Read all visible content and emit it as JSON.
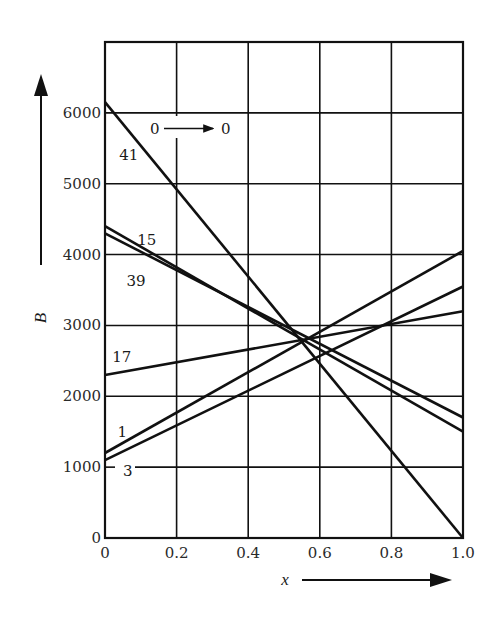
{
  "chart_data": {
    "type": "line",
    "title": "",
    "xlabel": "x",
    "ylabel": "B",
    "xlim": [
      0,
      1.0
    ],
    "ylim": [
      0,
      7000
    ],
    "grid": true,
    "legend": "inline labels near left axis",
    "x_ticks": [
      "0",
      "0.2",
      "0.4",
      "0.6",
      "0.8",
      "1.0"
    ],
    "x_tick_values": [
      0,
      0.2,
      0.4,
      0.6,
      0.8,
      1.0
    ],
    "y_ticks": [
      "0",
      "1000",
      "2000",
      "3000",
      "4000",
      "5000",
      "6000"
    ],
    "y_tick_values": [
      0,
      1000,
      2000,
      3000,
      4000,
      5000,
      6000
    ],
    "y_grid_values": [
      1000,
      2000,
      3000,
      4000,
      5000,
      6000,
      7000
    ],
    "x": [
      0,
      1.0
    ],
    "series": [
      {
        "name": "41",
        "values": [
          6150,
          0
        ],
        "label_pos": [
          0.04,
          5400
        ]
      },
      {
        "name": "15",
        "values": [
          4400,
          1500
        ],
        "label_pos": [
          0.09,
          4200
        ]
      },
      {
        "name": "39",
        "values": [
          4300,
          1700
        ],
        "label_pos": [
          0.06,
          3630
        ]
      },
      {
        "name": "17",
        "values": [
          2300,
          3200
        ],
        "label_pos": [
          0.02,
          2560
        ]
      },
      {
        "name": "1",
        "values": [
          1200,
          4050
        ],
        "label_pos": [
          0.035,
          1500
        ]
      },
      {
        "name": "3",
        "values": [
          1100,
          3550
        ],
        "label_pos": [
          0.05,
          950
        ]
      }
    ],
    "annotations": [
      {
        "text": "0",
        "x": 0.13,
        "y": 5870
      },
      {
        "text": "0",
        "x": 0.33,
        "y": 5870
      }
    ]
  },
  "labels": {
    "y_axis_title": "B",
    "x_axis_title": "x",
    "annotation_from": "0",
    "annotation_to": "0"
  },
  "colors": {
    "ink": "#111111",
    "background": "#ffffff"
  }
}
